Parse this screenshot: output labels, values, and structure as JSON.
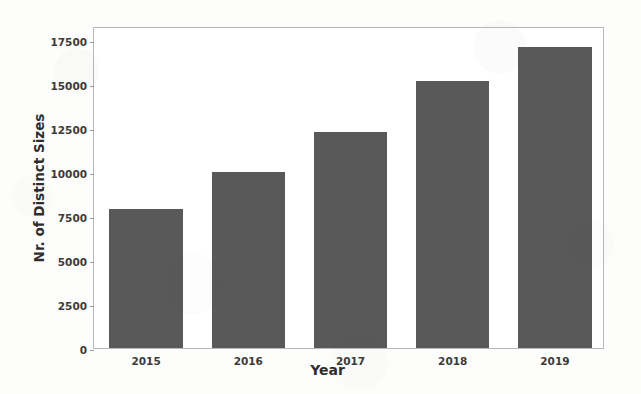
{
  "chart_data": {
    "type": "bar",
    "title": "",
    "xlabel": "Year",
    "ylabel": "Nr. of Distinct Sizes",
    "categories": [
      "2015",
      "2016",
      "2017",
      "2018",
      "2019"
    ],
    "values": [
      7900,
      10000,
      12300,
      15200,
      17100
    ],
    "series": [
      {
        "name": "Nr. of Distinct Sizes",
        "values": [
          7900,
          10000,
          12300,
          15200,
          17100
        ]
      }
    ],
    "ylim": [
      0,
      18300
    ],
    "yticks": [
      0,
      2500,
      5000,
      7500,
      10000,
      12500,
      15000,
      17500
    ],
    "ytick_labels": [
      "0",
      "2500",
      "5000",
      "7500",
      "10000",
      "12500",
      "15000",
      "17500"
    ],
    "xtick_labels": [
      "2015",
      "2016",
      "2017",
      "2018",
      "2019"
    ],
    "grid": false,
    "legend": false,
    "legend_position": "none",
    "bar_color": "#595959",
    "plot_background": "#ffffff",
    "figure_background": "#fdfdfc",
    "axis_color": "#b9b9b9",
    "tick_label_color": "#3b3b3b",
    "axis_label_color": "#2e2e2e"
  }
}
